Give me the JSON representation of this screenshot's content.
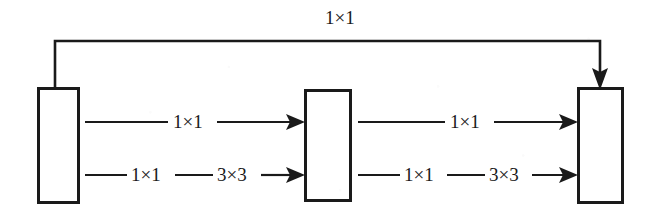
{
  "diagram": {
    "title": "",
    "type": "inception-style-block-diagram",
    "colors": {
      "stroke": "#1a1a1a",
      "background": "#ffffff",
      "text": "#1a1a1a"
    },
    "blocks": [
      {
        "id": "block-left",
        "label": "",
        "x": 38,
        "y": 88,
        "width": 40,
        "height": 114
      },
      {
        "id": "block-middle",
        "label": "",
        "x": 305,
        "y": 90,
        "width": 45,
        "height": 110
      },
      {
        "id": "block-right",
        "label": "",
        "x": 578,
        "y": 88,
        "width": 44,
        "height": 114
      }
    ],
    "skip_connection": {
      "label": "1×1",
      "label_x": 325,
      "label_y": 10,
      "from_block": "block-left",
      "to_block": "block-right",
      "path": "M 55 88 L 55 41 L 600 41 L 600 83",
      "arrow_direction": "down"
    },
    "paths": [
      {
        "id": "path-left-top",
        "from_block": "block-left",
        "to_block": "block-middle",
        "row": "top",
        "y": 122,
        "labels": [
          {
            "text": "1×1",
            "x": 173,
            "y": 112
          }
        ],
        "segments": [
          {
            "x1": 85,
            "y1": 122,
            "x2": 168,
            "y2": 122
          },
          {
            "x1": 217,
            "y1": 122,
            "x2": 290,
            "y2": 122
          }
        ],
        "arrow": {
          "x": 305,
          "y": 122
        }
      },
      {
        "id": "path-left-bottom",
        "from_block": "block-left",
        "to_block": "block-middle",
        "row": "bottom",
        "y": 175,
        "labels": [
          {
            "text": "1×1",
            "x": 131,
            "y": 165
          },
          {
            "text": "3×3",
            "x": 217,
            "y": 165
          }
        ],
        "segments": [
          {
            "x1": 85,
            "y1": 175,
            "x2": 127,
            "y2": 175
          },
          {
            "x1": 175,
            "y1": 175,
            "x2": 213,
            "y2": 175
          },
          {
            "x1": 261,
            "y1": 175,
            "x2": 290,
            "y2": 175
          }
        ],
        "arrow": {
          "x": 305,
          "y": 175
        }
      },
      {
        "id": "path-right-top",
        "from_block": "block-middle",
        "to_block": "block-right",
        "row": "top",
        "y": 122,
        "labels": [
          {
            "text": "1×1",
            "x": 450,
            "y": 112
          }
        ],
        "segments": [
          {
            "x1": 358,
            "y1": 122,
            "x2": 445,
            "y2": 122
          },
          {
            "x1": 494,
            "y1": 122,
            "x2": 563,
            "y2": 122
          }
        ],
        "arrow": {
          "x": 578,
          "y": 122
        }
      },
      {
        "id": "path-right-bottom",
        "from_block": "block-middle",
        "to_block": "block-right",
        "row": "bottom",
        "y": 175,
        "labels": [
          {
            "text": "1×1",
            "x": 404,
            "y": 165
          },
          {
            "text": "3×3",
            "x": 489,
            "y": 165
          }
        ],
        "segments": [
          {
            "x1": 358,
            "y1": 175,
            "x2": 400,
            "y2": 175
          },
          {
            "x1": 447,
            "y1": 175,
            "x2": 485,
            "y2": 175
          },
          {
            "x1": 532,
            "y1": 175,
            "x2": 563,
            "y2": 175
          }
        ],
        "arrow": {
          "x": 578,
          "y": 175
        }
      }
    ]
  }
}
